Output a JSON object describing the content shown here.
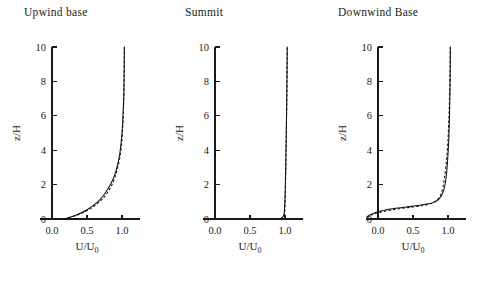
{
  "figure": {
    "panels": [
      {
        "id": "upwind",
        "title": "Upwind base",
        "xlabel": "U/U",
        "xlabel_sub": "0",
        "ylabel": "z/H"
      },
      {
        "id": "summit",
        "title": "Summit",
        "xlabel": "U/U",
        "xlabel_sub": "0",
        "ylabel": "z/H"
      },
      {
        "id": "downwind",
        "title": "Downwind Base",
        "xlabel": "U/U",
        "xlabel_sub": "0",
        "ylabel": "z/H"
      }
    ],
    "xticklabels": [
      "0.0",
      "0.5",
      "1.0"
    ],
    "yticklabels": [
      "0",
      "2",
      "4",
      "6",
      "8",
      "10"
    ]
  },
  "chart_data": [
    {
      "type": "line",
      "title": "Upwind base",
      "xlabel": "U/U0",
      "ylabel": "z/H",
      "xlim": [
        -0.22,
        1.25
      ],
      "ylim": [
        0,
        10
      ],
      "xticks": [
        0.0,
        0.5,
        1.0
      ],
      "yticks": [
        0,
        2,
        4,
        6,
        8,
        10
      ],
      "grid": false,
      "legend": "none",
      "series": [
        {
          "name": "solid",
          "style": "solid",
          "x": [
            0.17,
            0.21,
            0.27,
            0.34,
            0.42,
            0.5,
            0.58,
            0.66,
            0.73,
            0.79,
            0.85,
            0.9,
            0.94,
            0.97,
            0.99,
            1.005,
            1.015,
            1.025,
            1.03,
            1.032,
            1.033
          ],
          "y": [
            0.0,
            0.05,
            0.12,
            0.22,
            0.36,
            0.54,
            0.76,
            1.02,
            1.34,
            1.7,
            2.12,
            2.62,
            3.2,
            3.85,
            4.55,
            5.3,
            6.1,
            7.1,
            8.2,
            9.2,
            10.0
          ]
        },
        {
          "name": "dashed",
          "style": "dashed",
          "x": [
            0.17,
            0.22,
            0.29,
            0.37,
            0.46,
            0.55,
            0.63,
            0.71,
            0.78,
            0.84,
            0.89,
            0.93,
            0.965,
            0.99,
            1.005,
            1.015,
            1.022,
            1.028,
            1.031,
            1.033,
            1.034
          ],
          "y": [
            0.0,
            0.05,
            0.13,
            0.24,
            0.4,
            0.6,
            0.84,
            1.12,
            1.46,
            1.86,
            2.32,
            2.86,
            3.48,
            4.18,
            4.92,
            5.7,
            6.55,
            7.5,
            8.5,
            9.3,
            10.0
          ]
        }
      ]
    },
    {
      "type": "line",
      "title": "Summit",
      "xlabel": "U/U0",
      "ylabel": "z/H",
      "xlim": [
        -0.22,
        1.25
      ],
      "ylim": [
        0,
        10
      ],
      "xticks": [
        0.0,
        0.5,
        1.0
      ],
      "yticks": [
        0,
        2,
        4,
        6,
        8,
        10
      ],
      "grid": false,
      "legend": "none",
      "series": [
        {
          "name": "solid",
          "style": "solid",
          "x": [
            0.93,
            0.96,
            0.975,
            0.985,
            0.99,
            0.995,
            1.0,
            1.005,
            1.01,
            1.015,
            1.02,
            1.025,
            1.028,
            1.03,
            1.032
          ],
          "y": [
            0.0,
            0.08,
            0.16,
            0.26,
            0.4,
            0.7,
            1.2,
            2.0,
            3.0,
            4.2,
            5.5,
            6.9,
            8.2,
            9.2,
            10.0
          ]
        },
        {
          "name": "dashed",
          "style": "dashed",
          "x": [
            0.93,
            0.965,
            0.982,
            0.992,
            0.997,
            1.0,
            1.004,
            1.008,
            1.013,
            1.017,
            1.021,
            1.026,
            1.029,
            1.031,
            1.033
          ],
          "y": [
            0.0,
            0.1,
            0.2,
            0.32,
            0.48,
            0.8,
            1.35,
            2.15,
            3.15,
            4.35,
            5.6,
            7.0,
            8.3,
            9.25,
            10.0
          ]
        }
      ]
    },
    {
      "type": "line",
      "title": "Downwind Base",
      "xlabel": "U/U0",
      "ylabel": "z/H",
      "xlim": [
        -0.22,
        1.25
      ],
      "ylim": [
        0,
        10
      ],
      "xticks": [
        0.0,
        0.5,
        1.0
      ],
      "yticks": [
        0,
        2,
        4,
        6,
        8,
        10
      ],
      "grid": false,
      "legend": "none",
      "series": [
        {
          "name": "solid",
          "style": "solid",
          "x": [
            -0.16,
            -0.13,
            -0.08,
            0.0,
            0.12,
            0.28,
            0.45,
            0.6,
            0.72,
            0.8,
            0.86,
            0.9,
            0.935,
            0.96,
            0.98,
            0.995,
            1.01,
            1.02,
            1.028,
            1.032,
            1.034
          ],
          "y": [
            0.12,
            0.2,
            0.3,
            0.42,
            0.54,
            0.64,
            0.72,
            0.8,
            0.88,
            0.98,
            1.12,
            1.32,
            1.62,
            2.05,
            2.65,
            3.45,
            4.5,
            5.8,
            7.3,
            8.8,
            10.0
          ]
        },
        {
          "name": "dashed",
          "style": "dashed",
          "x": [
            -0.16,
            -0.12,
            -0.06,
            0.04,
            0.18,
            0.34,
            0.5,
            0.64,
            0.75,
            0.82,
            0.87,
            0.905,
            0.93,
            0.95,
            0.97,
            0.988,
            1.003,
            1.015,
            1.024,
            1.03,
            1.033
          ],
          "y": [
            0.1,
            0.18,
            0.28,
            0.4,
            0.52,
            0.62,
            0.7,
            0.78,
            0.88,
            1.02,
            1.22,
            1.5,
            1.9,
            2.4,
            3.05,
            3.85,
            4.85,
            6.1,
            7.55,
            8.95,
            10.0
          ]
        }
      ]
    }
  ]
}
